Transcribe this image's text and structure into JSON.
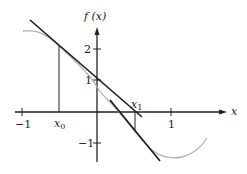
{
  "diagram": {
    "y_axis_label": "f (x)",
    "x_axis_label": "x",
    "x_ticks": [
      {
        "label": "−1",
        "value": -1
      },
      {
        "label": "1",
        "value": 1
      }
    ],
    "y_ticks": [
      {
        "label": "2",
        "value": 2
      },
      {
        "label": "1",
        "value": 1
      },
      {
        "label": "−1",
        "value": -1
      }
    ],
    "points": {
      "x0_label": "x",
      "x0_sub": "0",
      "x1_label": "x",
      "x1_sub": "1"
    },
    "colors": {
      "axis": "#222222",
      "tangent": "#1a1a1a",
      "curve": "#b0b0b0",
      "background": "#ffffff"
    }
  }
}
